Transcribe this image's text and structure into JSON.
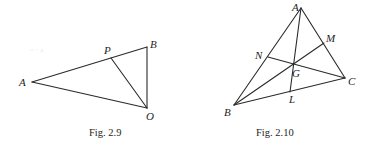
{
  "figures": [
    {
      "id": "fig-2-9",
      "caption": "Fig. 2.9",
      "vertices": {
        "A": {
          "label": "A",
          "x": 32,
          "y": 82
        },
        "B": {
          "label": "B",
          "x": 147,
          "y": 47
        },
        "O": {
          "label": "O",
          "x": 147,
          "y": 108
        },
        "P": {
          "label": "P",
          "x": 111,
          "y": 58
        }
      },
      "segments": [
        [
          "A",
          "B"
        ],
        [
          "B",
          "O"
        ],
        [
          "O",
          "A"
        ],
        [
          "P",
          "O"
        ]
      ]
    },
    {
      "id": "fig-2-10",
      "caption": "Fig. 2.10",
      "vertices": {
        "A": {
          "label": "A",
          "x": 301,
          "y": 8
        },
        "B": {
          "label": "B",
          "x": 234,
          "y": 105
        },
        "C": {
          "label": "C",
          "x": 345,
          "y": 78
        },
        "M": {
          "label": "M",
          "x": 324,
          "y": 43
        },
        "N": {
          "label": "N",
          "x": 268,
          "y": 57
        },
        "L": {
          "label": "L",
          "x": 290,
          "y": 92
        },
        "G": {
          "label": "G",
          "x": 293,
          "y": 64
        }
      },
      "segments": [
        [
          "A",
          "B"
        ],
        [
          "B",
          "C"
        ],
        [
          "C",
          "A"
        ],
        [
          "A",
          "L"
        ],
        [
          "B",
          "M"
        ],
        [
          "C",
          "N"
        ]
      ]
    }
  ],
  "colors": {
    "line": "#2a2a2a",
    "text": "#1e1e1e",
    "background": "#ffffff"
  }
}
